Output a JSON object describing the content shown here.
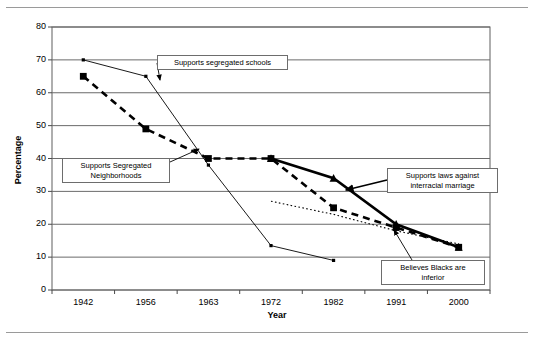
{
  "document": {
    "top_rule": "",
    "bottom_rule": ""
  },
  "chart_data": {
    "type": "line",
    "title": "",
    "xlabel": "Year",
    "ylabel": "Percentage",
    "categories": [
      "1942",
      "1956",
      "1963",
      "1972",
      "1982",
      "1991",
      "2000"
    ],
    "ylim": [
      0,
      80
    ],
    "yticks": [
      0,
      10,
      20,
      30,
      40,
      50,
      60,
      70,
      80
    ],
    "ytick_labels": [
      "0",
      "10",
      "20",
      "30",
      "40",
      "50",
      "60",
      "70",
      "80"
    ],
    "grid": true,
    "legend": "none",
    "annotations": [
      {
        "id": "supports-segregated-schools",
        "text": "Supports segregated schools",
        "target_category": "1956",
        "target_value": 65
      },
      {
        "id": "supports-segregated-neighborhoods",
        "text": "Supports Segregated\nNeighborhoods",
        "target_category": "1963",
        "target_value": 44
      },
      {
        "id": "supports-laws-against-interracial-marriage",
        "text": "Supports laws against\ninterracial marriage",
        "target_category": "1982",
        "target_value": 34
      },
      {
        "id": "believes-blacks-are-inferior",
        "text": "Believes Blacks are\ninferior",
        "target_category": "1986",
        "target_value": 22
      }
    ],
    "series": [
      {
        "name": "Supports segregated schools",
        "style": "thin-solid",
        "color": "#000000",
        "marker": "small-diamond",
        "x": [
          "1942",
          "1956",
          "1963",
          "1972",
          "1982"
        ],
        "values": [
          70,
          65,
          38,
          13.5,
          9
        ]
      },
      {
        "name": "Supports Segregated Neighborhoods",
        "style": "dashed",
        "color": "#000000",
        "marker": "square",
        "x": [
          "1942",
          "1956",
          "1963",
          "1972",
          "1982",
          "1991",
          "2000"
        ],
        "values": [
          65,
          49,
          40,
          40,
          25,
          19,
          13
        ]
      },
      {
        "name": "Supports laws against interracial marriage",
        "style": "thick-solid",
        "color": "#000000",
        "marker": "triangle",
        "x": [
          "1972",
          "1982",
          "1991",
          "2000"
        ],
        "values": [
          40,
          34,
          20,
          13
        ]
      },
      {
        "name": "Believes Blacks are inferior",
        "style": "dotted",
        "color": "#000000",
        "marker": "none",
        "x": [
          "1972",
          "1982",
          "1991",
          "2000"
        ],
        "values": [
          27,
          23,
          18,
          14
        ]
      }
    ]
  }
}
